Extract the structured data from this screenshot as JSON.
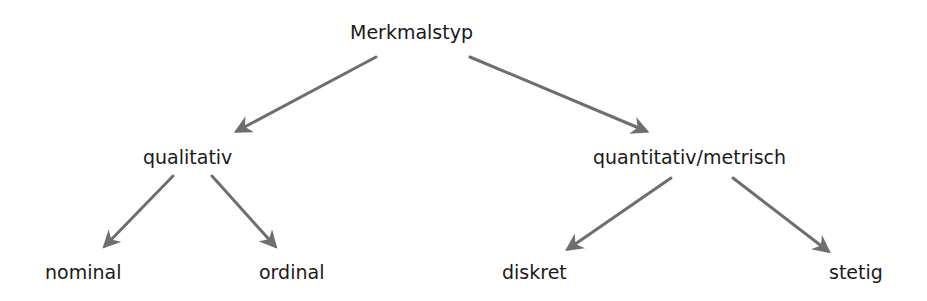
{
  "diagram": {
    "type": "tree",
    "edge_color": "#6e6e6e",
    "text_color": "#1a1a1a",
    "root": {
      "label": "Merkmalstyp"
    },
    "level1": [
      {
        "label": "qualitativ"
      },
      {
        "label": "quantitativ/metrisch"
      }
    ],
    "level2": [
      {
        "label": "nominal",
        "parent": "qualitativ"
      },
      {
        "label": "ordinal",
        "parent": "qualitativ"
      },
      {
        "label": "diskret",
        "parent": "quantitativ/metrisch"
      },
      {
        "label": "stetig",
        "parent": "quantitativ/metrisch"
      }
    ],
    "edges": [
      {
        "from": "Merkmalstyp",
        "to": "qualitativ"
      },
      {
        "from": "Merkmalstyp",
        "to": "quantitativ/metrisch"
      },
      {
        "from": "qualitativ",
        "to": "nominal"
      },
      {
        "from": "qualitativ",
        "to": "ordinal"
      },
      {
        "from": "quantitativ/metrisch",
        "to": "diskret"
      },
      {
        "from": "quantitativ/metrisch",
        "to": "stetig"
      }
    ]
  }
}
